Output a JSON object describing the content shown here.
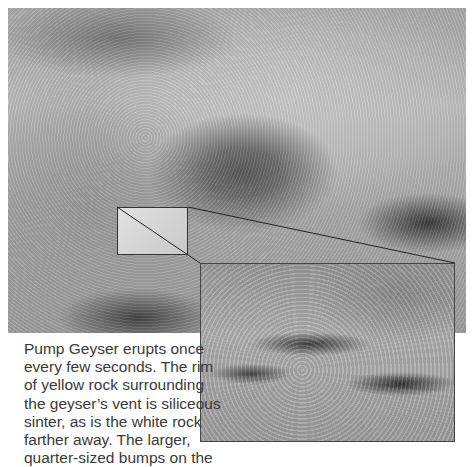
{
  "figure": {
    "main_photo_alt": "Pump Geyser vent surrounded by siliceous sinter",
    "inset_photo_alt": "Close-up of quarter-sized sinter bumps",
    "caption_lines": [
      "Pump Geyser erupts once",
      "every few seconds. The rim",
      "of yellow rock surrounding",
      "the geyser’s vent is siliceous",
      "sinter, as is the white rock",
      "farther away. The larger,",
      "quarter-sized bumps on the"
    ]
  }
}
